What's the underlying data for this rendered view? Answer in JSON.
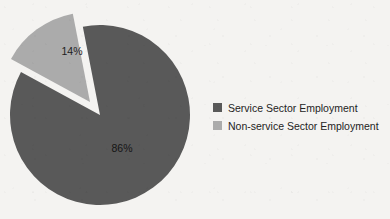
{
  "chart_data": {
    "type": "pie",
    "title": "",
    "categories": [
      "Service Sector Employment",
      "Non-service Sector Employment"
    ],
    "values": [
      86,
      14
    ],
    "value_labels": [
      "86%",
      "14%"
    ],
    "unit": "percent",
    "colors": [
      "#595959",
      "#ababab"
    ],
    "exploded_slices": [
      "Non-service Sector Employment"
    ],
    "legend_position": "right",
    "grid": false,
    "slices": [
      {
        "label": "Service Sector Employment",
        "value": 86,
        "display": "86%",
        "color": "#595959",
        "exploded": false
      },
      {
        "label": "Non-service Sector Employment",
        "value": 14,
        "display": "14%",
        "color": "#ababab",
        "exploded": true
      }
    ]
  },
  "legend": {
    "items": [
      {
        "label": "Service Sector Employment",
        "color": "#595959"
      },
      {
        "label": "Non-service Sector Employment",
        "color": "#ababab"
      }
    ]
  },
  "labels": {
    "major_slice": "86%",
    "minor_slice": "14%"
  },
  "background_color": "#f4f3f1"
}
